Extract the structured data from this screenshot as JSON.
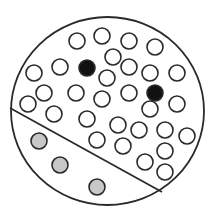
{
  "diagram": {
    "type": "particle-container",
    "colors": {
      "background": "#ffffff",
      "stroke": "#2a2a2a",
      "hollow_fill": "#ffffff",
      "dark_fill": "#111111",
      "gray_fill": "#c8c8c8"
    },
    "container": {
      "cx": 107.5,
      "cy": 111,
      "rx": 96.5,
      "ry": 94,
      "stroke_width": 1.8
    },
    "divider": {
      "x1": 10,
      "y1": 108,
      "x2": 162,
      "y2": 192,
      "stroke_width": 1.8
    },
    "particle_radius": 8,
    "particles": {
      "hollow": [
        [
          77,
          41
        ],
        [
          102,
          36
        ],
        [
          129,
          41
        ],
        [
          155,
          47
        ],
        [
          113,
          57
        ],
        [
          34,
          73
        ],
        [
          60,
          67
        ],
        [
          107,
          78
        ],
        [
          129,
          67
        ],
        [
          150,
          73
        ],
        [
          177,
          73
        ],
        [
          44,
          93
        ],
        [
          76,
          93
        ],
        [
          102,
          99
        ],
        [
          129,
          93
        ],
        [
          28,
          104
        ],
        [
          54,
          114
        ],
        [
          87,
          119
        ],
        [
          150,
          109
        ],
        [
          177,
          104
        ],
        [
          118,
          125
        ],
        [
          139,
          130
        ],
        [
          165,
          130
        ],
        [
          187,
          136
        ],
        [
          97,
          140
        ],
        [
          123,
          146
        ],
        [
          165,
          151
        ],
        [
          145,
          162
        ],
        [
          165,
          172
        ]
      ],
      "dark": [
        [
          87,
          68
        ],
        [
          155,
          93
        ]
      ],
      "gray": [
        [
          39,
          141
        ],
        [
          60,
          165
        ],
        [
          97,
          187
        ]
      ]
    }
  }
}
